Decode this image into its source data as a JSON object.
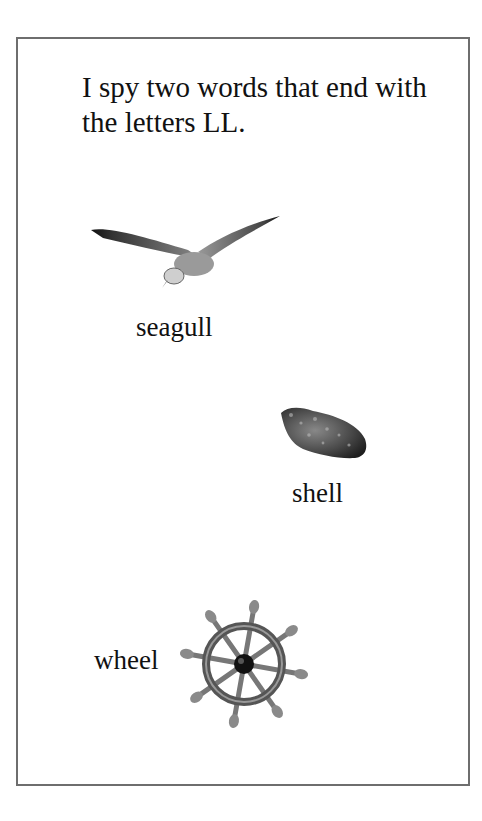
{
  "page": {
    "prompt": "I spy two words that end with the letters LL.",
    "items": [
      {
        "label": "seagull",
        "icon": "seagull-icon"
      },
      {
        "label": "shell",
        "icon": "shell-icon"
      },
      {
        "label": "wheel",
        "icon": "ship-wheel-icon"
      }
    ]
  }
}
